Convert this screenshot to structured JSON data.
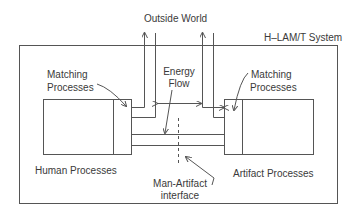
{
  "diagram": {
    "title": "H–LAM/T System",
    "outside_label": "Outside World",
    "labels": {
      "matching_left_1": "Matching",
      "matching_left_2": "Processes",
      "matching_right_1": "Matching",
      "matching_right_2": "Processes",
      "energy_1": "Energy",
      "energy_2": "Flow",
      "human": "Human Processes",
      "artifact": "Artifact Processes",
      "interface_1": "Man-Artifact",
      "interface_2": "interface"
    },
    "colors": {
      "line": "#555555",
      "text": "#3a3a3a",
      "background": "#ffffff"
    }
  }
}
